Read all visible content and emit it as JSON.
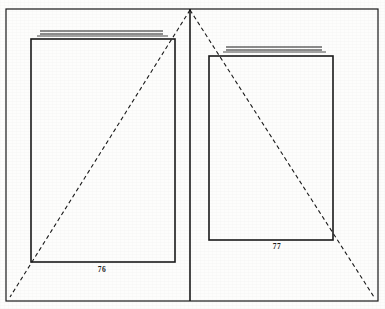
{
  "figure": {
    "type": "line-diagram",
    "background_color": "#fdfdfc",
    "ink_color": "#1a1a1a",
    "outer_frame": {
      "x": 6,
      "y": 9,
      "width": 372,
      "height": 292,
      "stroke_width": 1.2
    },
    "gutter_line": {
      "x": 190,
      "y_top": 9,
      "y_bottom": 301,
      "stroke_width": 1.6
    },
    "apex": {
      "x": 190,
      "y": 10
    },
    "dashed_diagonals": [
      {
        "name": "left-diagonal",
        "x1": 190,
        "y1": 10,
        "x2": 10,
        "y2": 297,
        "dash": "4 3",
        "stroke_width": 1.1
      },
      {
        "name": "right-diagonal",
        "x1": 190,
        "y1": 10,
        "x2": 374,
        "y2": 297,
        "dash": "4 3",
        "stroke_width": 1.1
      }
    ],
    "pages": [
      {
        "name": "left-page",
        "label": "76",
        "rect": {
          "x": 31,
          "y": 39,
          "width": 144,
          "height": 223
        },
        "stroke_width": 1.6,
        "label_position": {
          "x": 102,
          "y": 269
        },
        "rules": [
          {
            "x1": 40,
            "y1": 31,
            "x2": 163,
            "y2": 31,
            "stroke_width": 1.0
          },
          {
            "x1": 40,
            "y1": 34,
            "x2": 163,
            "y2": 34,
            "stroke_width": 1.0
          },
          {
            "x1": 37,
            "y1": 36,
            "x2": 168,
            "y2": 36,
            "stroke_width": 0.8
          }
        ]
      },
      {
        "name": "right-page",
        "label": "77",
        "rect": {
          "x": 209,
          "y": 56,
          "width": 124,
          "height": 184
        },
        "stroke_width": 1.6,
        "label_position": {
          "x": 277,
          "y": 246
        },
        "rules": [
          {
            "x1": 226,
            "y1": 47,
            "x2": 322,
            "y2": 47,
            "stroke_width": 1.0
          },
          {
            "x1": 226,
            "y1": 50,
            "x2": 322,
            "y2": 50,
            "stroke_width": 1.0
          },
          {
            "x1": 223,
            "y1": 52,
            "x2": 326,
            "y2": 52,
            "stroke_width": 0.8
          }
        ]
      }
    ]
  }
}
